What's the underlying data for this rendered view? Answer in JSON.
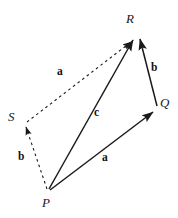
{
  "figure": {
    "kind": "vector-diagram",
    "background_color": "#ffffff",
    "stroke_color": "#1a1a1a",
    "width": 178,
    "height": 218
  },
  "points": [
    {
      "id": "R",
      "label": "R",
      "x": 137,
      "y": 37,
      "label_x": 126,
      "label_y": 12
    },
    {
      "id": "Q",
      "label": "Q",
      "x": 157,
      "y": 109,
      "label_x": 160,
      "label_y": 96
    },
    {
      "id": "P",
      "label": "P",
      "x": 48,
      "y": 192,
      "label_x": 42,
      "label_y": 196
    },
    {
      "id": "S",
      "label": "S",
      "x": 24,
      "y": 124,
      "label_x": 8,
      "label_y": 110
    }
  ],
  "vectors": [
    {
      "id": "PQ",
      "label": "a",
      "style": "solid",
      "arrow": "end",
      "from": "P",
      "to": "Q",
      "x1": 50,
      "y1": 190,
      "x2": 153,
      "y2": 112,
      "label_x": 102,
      "label_y": 152
    },
    {
      "id": "QR",
      "label": "b",
      "style": "solid",
      "arrow": "end",
      "from": "Q",
      "to": "R",
      "x1": 157,
      "y1": 106,
      "x2": 140,
      "y2": 39,
      "label_x": 151,
      "label_y": 62
    },
    {
      "id": "PR",
      "label": "c",
      "style": "solid",
      "arrow": "end",
      "from": "P",
      "to": "R",
      "x1": 49,
      "y1": 189,
      "x2": 133,
      "y2": 40,
      "label_x": 94,
      "label_y": 107
    },
    {
      "id": "SR",
      "label": "a",
      "style": "dashed",
      "arrow": "end",
      "from": "S",
      "to": "R",
      "x1": 27,
      "y1": 122,
      "x2": 131,
      "y2": 42,
      "label_x": 57,
      "label_y": 66
    },
    {
      "id": "PS",
      "label": "b",
      "style": "dashed",
      "arrow": "end",
      "from": "P",
      "to": "S",
      "x1": 47,
      "y1": 189,
      "x2": 26,
      "y2": 127,
      "label_x": 18,
      "label_y": 151
    }
  ]
}
